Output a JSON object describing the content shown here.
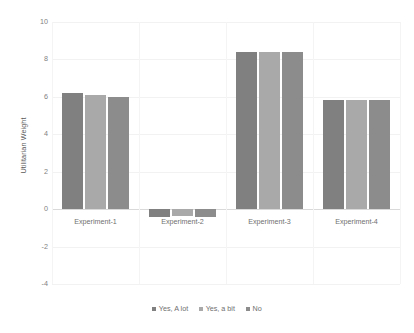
{
  "chart_data": {
    "type": "bar",
    "title": "",
    "subtitle": "",
    "xlabel": "",
    "ylabel": "Utilitarian Weight",
    "categories": [
      "Experiment-1",
      "Experiment-2",
      "Experiment-3",
      "Experiment-4"
    ],
    "series": [
      {
        "name": "Yes, A lot",
        "color": "#808080",
        "values": [
          6.2,
          -0.4,
          8.4,
          5.85
        ]
      },
      {
        "name": "Yes, a bit",
        "color": "#a9a9a9",
        "values": [
          6.1,
          -0.35,
          8.4,
          5.85
        ]
      },
      {
        "name": "No",
        "color": "#8c8c8c",
        "values": [
          6.0,
          -0.4,
          8.4,
          5.85
        ]
      }
    ],
    "ylim": [
      -4,
      10
    ],
    "ytick_values": [
      10,
      8,
      6,
      4,
      2,
      0,
      -2,
      -4
    ],
    "ytick_labels": [
      "10",
      "8",
      "6",
      "4",
      "2",
      "0",
      "-2",
      "-4"
    ],
    "grid": true,
    "legend_position": "bottom",
    "legend_entries": [
      "Yes, A lot",
      "Yes, a bit",
      "No"
    ]
  }
}
